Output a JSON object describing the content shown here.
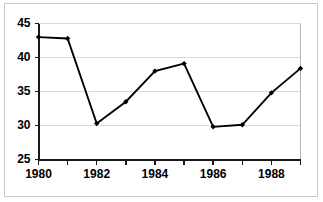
{
  "chart_data": {
    "type": "line",
    "title": "",
    "xlabel": "",
    "ylabel": "",
    "x": [
      1980,
      1981,
      1982,
      1983,
      1984,
      1985,
      1986,
      1987,
      1988,
      1989
    ],
    "values": [
      43.0,
      42.8,
      30.3,
      33.5,
      38.0,
      39.1,
      29.8,
      30.1,
      34.8,
      38.4
    ],
    "series": [
      {
        "name": "",
        "values": [
          43.0,
          42.8,
          30.3,
          33.5,
          38.0,
          39.1,
          29.8,
          30.1,
          34.8,
          38.4
        ]
      }
    ],
    "xlim": [
      1980,
      1989
    ],
    "ylim": [
      25,
      45
    ],
    "ytick_labels": [
      "25",
      "30",
      "35",
      "40",
      "45"
    ],
    "ytick_values": [
      25,
      30,
      35,
      40,
      45
    ],
    "xtick_values": [
      1980,
      1981,
      1982,
      1983,
      1984,
      1985,
      1986,
      1987,
      1988,
      1989
    ],
    "xtick_labels": [
      "1980",
      "",
      "1982",
      "",
      "1984",
      "",
      "1986",
      "",
      "1988",
      ""
    ],
    "xtick_labels_shown": [
      "1980",
      "1982",
      "1984",
      "1986",
      "1988"
    ],
    "grid": true,
    "grid_axis": "y",
    "legend": false,
    "legend_position": "none",
    "marker": "diamond",
    "line_color": "#000000",
    "marker_color": "#000000",
    "grid_color": "#d9d9d9",
    "background_color": "#ffffff",
    "frame_color": "#c8c8c8",
    "annotations": []
  }
}
